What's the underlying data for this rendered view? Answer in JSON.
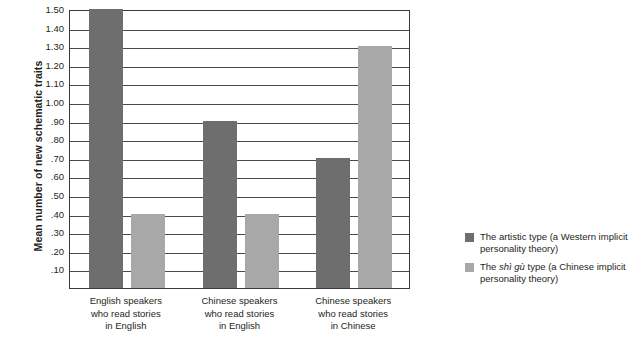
{
  "chart_data": {
    "type": "bar",
    "title": "",
    "xlabel": "",
    "ylabel": "Mean number of new schematic traits",
    "ylim": [
      0,
      1.5
    ],
    "grid": true,
    "legend_position": "right",
    "categories": [
      "English speakers who read stories in English",
      "Chinese speakers who read stories in English",
      "Chinese speakers who read stories in Chinese"
    ],
    "category_lines": [
      [
        "English speakers",
        "who read stories",
        "in English"
      ],
      [
        "Chinese speakers",
        "who read stories",
        "in English"
      ],
      [
        "Chinese speakers",
        "who read stories",
        "in Chinese"
      ]
    ],
    "series": [
      {
        "name": "The artistic type (a Western implicit personality theory)",
        "color": "#6e6e6e",
        "values": [
          1.5,
          0.9,
          0.7
        ]
      },
      {
        "name": "The shì gù type (a Chinese implicit personality theory)",
        "color": "#a8a8a8",
        "values": [
          0.4,
          0.4,
          1.3
        ]
      }
    ],
    "ytick_labels": [
      "1.50",
      "1.40",
      "1.30",
      "1.20",
      "1.10",
      "1.00",
      ".90",
      ".80",
      ".70",
      ".60",
      ".50",
      ".40",
      ".30",
      ".20",
      ".10"
    ],
    "ytick_values": [
      1.5,
      1.4,
      1.3,
      1.2,
      1.1,
      1.0,
      0.9,
      0.8,
      0.7,
      0.6,
      0.5,
      0.4,
      0.3,
      0.2,
      0.1
    ]
  },
  "legend": {
    "items": [
      {
        "swatch": "dark",
        "prefix": "The ",
        "italic": "",
        "suffix": "artistic type (a Western implicit personality theory)"
      },
      {
        "swatch": "light",
        "prefix": "The ",
        "italic": "shì gù",
        "suffix": " type (a Chinese implicit personality theory)"
      }
    ]
  }
}
